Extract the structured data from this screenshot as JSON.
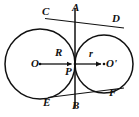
{
  "figure": {
    "width": 139,
    "height": 117,
    "stroke_color": "#111111",
    "background_color": "#ffffff"
  },
  "labels": {
    "C": "C",
    "A": "A",
    "D": "D",
    "O": "O",
    "R": "R",
    "r": "r",
    "O_prime": "O'",
    "P": "P",
    "E": "E",
    "B": "B",
    "F": "F"
  },
  "geometry": {
    "large_circle": {
      "center_label": "O",
      "cx": 40,
      "cy": 64,
      "radius": 35,
      "radius_label": "R"
    },
    "small_circle": {
      "center_label": "O'",
      "cx": 104,
      "cy": 64,
      "radius": 29,
      "radius_label": "r"
    },
    "tangency_point": {
      "label": "P",
      "x": 75,
      "y": 64
    },
    "vertical_tangent_line": {
      "top_label": "A",
      "bottom_label": "B",
      "x": 75,
      "y_top": 8,
      "y_bottom": 108
    },
    "upper_tangent_line": {
      "from_label": "C",
      "to_label": "D",
      "x1": 47,
      "y1": 19,
      "x2": 122,
      "y2": 27
    },
    "lower_tangent_line": {
      "from_label": "E",
      "to_label": "F",
      "x1": 50,
      "y1": 97,
      "x2": 122,
      "y2": 88
    },
    "radius_arrow_left": {
      "label": "R",
      "from_x": 40,
      "from_y": 64,
      "to_x": 75,
      "to_y": 64
    },
    "radius_arrow_right": {
      "label": "r",
      "from_x": 75,
      "from_y": 64,
      "to_x": 104,
      "to_y": 64
    }
  }
}
